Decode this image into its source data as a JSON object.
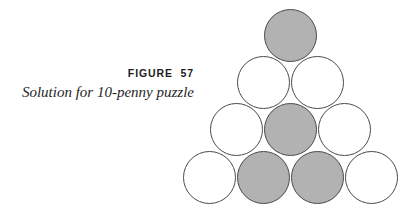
{
  "figure": {
    "label": "FIGURE  57",
    "caption": "Solution for 10-penny puzzle"
  },
  "colors": {
    "background": "#ffffff",
    "penny_outline": "#4a4a4a",
    "penny_shaded_fill": "#b2b2b2",
    "penny_empty_fill": "#ffffff",
    "label_text": "#1c1c1c",
    "caption_text": "#262626"
  },
  "chart_data": {
    "type": "diagram",
    "title": "Solution for 10-penny puzzle",
    "rows": [
      {
        "row": 1,
        "count": 1,
        "pennies": [
          {
            "index": 1,
            "state": "shaded",
            "fill": "#b2b2b2",
            "cx": 290,
            "cy": 35,
            "r": 26.5
          }
        ]
      },
      {
        "row": 2,
        "count": 2,
        "pennies": [
          {
            "index": 2,
            "state": "empty",
            "fill": "#ffffff",
            "cx": 263,
            "cy": 82,
            "r": 26.5
          },
          {
            "index": 3,
            "state": "empty",
            "fill": "#ffffff",
            "cx": 317,
            "cy": 82,
            "r": 26.5
          }
        ]
      },
      {
        "row": 3,
        "count": 3,
        "pennies": [
          {
            "index": 4,
            "state": "empty",
            "fill": "#ffffff",
            "cx": 236,
            "cy": 129,
            "r": 26.5
          },
          {
            "index": 5,
            "state": "shaded",
            "fill": "#b2b2b2",
            "cx": 290,
            "cy": 129,
            "r": 26.5
          },
          {
            "index": 6,
            "state": "empty",
            "fill": "#ffffff",
            "cx": 344,
            "cy": 129,
            "r": 26.5
          }
        ]
      },
      {
        "row": 4,
        "count": 4,
        "pennies": [
          {
            "index": 7,
            "state": "empty",
            "fill": "#ffffff",
            "cx": 209,
            "cy": 177,
            "r": 26.5
          },
          {
            "index": 8,
            "state": "shaded",
            "fill": "#b2b2b2",
            "cx": 263,
            "cy": 177,
            "r": 26.5
          },
          {
            "index": 9,
            "state": "shaded",
            "fill": "#b2b2b2",
            "cx": 317,
            "cy": 177,
            "r": 26.5
          },
          {
            "index": 10,
            "state": "empty",
            "fill": "#ffffff",
            "cx": 371,
            "cy": 177,
            "r": 26.5
          }
        ]
      }
    ],
    "totals": {
      "pennies": 10,
      "shaded": 5,
      "empty": 5
    }
  }
}
